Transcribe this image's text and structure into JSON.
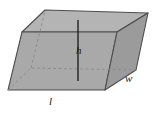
{
  "figure": {
    "name": "oblique-rectangular-prism",
    "background_color": "#ffffff",
    "labels": {
      "height": "h",
      "length": "l",
      "width": "w"
    },
    "colors": {
      "top_face": "#b0b0b0",
      "front_face": "#a8a8a8",
      "right_face": "#9a9a9a",
      "edge_stroke": "#4d4d4d",
      "hidden_edge_stroke": "#8c8c8c",
      "height_line": "#2b2b2b",
      "label_text": "#1a1a1a"
    },
    "geometry": {
      "top_face_points": "22,32 45,10 148,13 117,32",
      "front_face_points": "22,32 117,32 105,90 8,90",
      "right_face_points": "117,32 148,13 136,70 105,90",
      "hidden_back_bottom_left": "8,90 31,68",
      "hidden_back_bottom_right": "31,68 136,70",
      "hidden_vertical_back": "31,68 31,68",
      "height_line_top": "78,20",
      "height_line_bottom": "78,80"
    }
  }
}
